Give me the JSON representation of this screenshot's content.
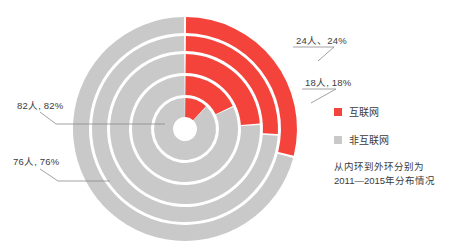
{
  "chart_data": {
    "type": "pie",
    "title": "",
    "subtitle": "",
    "variant": "nested-donut-sunburst",
    "center": {
      "x": 185,
      "y": 129
    },
    "start_angle_deg": 0,
    "direction": "clockwise",
    "inner_hole_radius": 12,
    "ring_gap": 3,
    "legend": {
      "position": "right",
      "entries": [
        {
          "label": "互联网",
          "color": "#f4433a"
        },
        {
          "label": "非互联网",
          "color": "#c9c9c9"
        }
      ]
    },
    "caption": "从内环到外环分别为\n2011—2015年分布情况",
    "categories": [
      "互联网",
      "非互联网"
    ],
    "rings": [
      {
        "name": "2011",
        "order": 1,
        "r_inner": 12,
        "r_outer": 31,
        "values": [
          12,
          88
        ],
        "slices": [
          {
            "label": "互联网",
            "value": 12,
            "color": "#f4433a"
          },
          {
            "label": "非互联网",
            "value": 88,
            "color": "#c9c9c9"
          }
        ]
      },
      {
        "name": "2012",
        "order": 2,
        "r_inner": 34,
        "r_outer": 53,
        "values": [
          18,
          82
        ],
        "slices": [
          {
            "label": "互联网",
            "value": 18,
            "color": "#f4433a"
          },
          {
            "label": "非互联网",
            "value": 82,
            "color": "#c9c9c9"
          }
        ]
      },
      {
        "name": "2013",
        "order": 3,
        "r_inner": 56,
        "r_outer": 75,
        "values": [
          24,
          76
        ],
        "slices": [
          {
            "label": "互联网",
            "value": 24,
            "color": "#f4433a"
          },
          {
            "label": "非互联网",
            "value": 76,
            "color": "#c9c9c9"
          }
        ]
      },
      {
        "name": "2014",
        "order": 4,
        "r_inner": 78,
        "r_outer": 93,
        "values": [
          26,
          74
        ],
        "slices": [
          {
            "label": "互联网",
            "value": 26,
            "color": "#f4433a"
          },
          {
            "label": "非互联网",
            "value": 74,
            "color": "#c9c9c9"
          }
        ]
      },
      {
        "name": "2015",
        "order": 5,
        "r_inner": 96,
        "r_outer": 112,
        "values": [
          29,
          71
        ],
        "slices": [
          {
            "label": "互联网",
            "value": 29,
            "color": "#f4433a"
          },
          {
            "label": "非互联网",
            "value": 71,
            "color": "#c9c9c9"
          }
        ]
      }
    ],
    "annotations": [
      {
        "id": "a24",
        "text": "24人、24%",
        "ring": "2013",
        "slice": "互联网",
        "value": 24,
        "unit_count": 24,
        "percent": "24%",
        "x": 296,
        "y": 36,
        "leader": [
          [
            293,
            47
          ],
          [
            334,
            47
          ],
          [
            318,
            61
          ]
        ]
      },
      {
        "id": "a18",
        "text": "18人, 18%",
        "ring": "2012",
        "slice": "互联网",
        "value": 18,
        "unit_count": 18,
        "percent": "18%",
        "x": 305,
        "y": 78,
        "leader": [
          [
            302,
            89
          ],
          [
            336,
            89
          ],
          [
            311,
            103
          ]
        ]
      },
      {
        "id": "a82",
        "text": "82人, 82%",
        "ring": "2012",
        "slice": "非互联网",
        "value": 82,
        "unit_count": 82,
        "percent": "82%",
        "x": 17,
        "y": 101,
        "leader": [
          [
            40,
            112
          ],
          [
            56,
            124
          ],
          [
            165,
            124
          ]
        ]
      },
      {
        "id": "a76",
        "text": "76人, 76%",
        "ring": "2013",
        "slice": "非互联网",
        "value": 76,
        "unit_count": 76,
        "percent": "76%",
        "x": 13,
        "y": 157,
        "leader": [
          [
            40,
            169
          ],
          [
            58,
            181
          ],
          [
            110,
            181
          ]
        ]
      }
    ],
    "colors": {
      "accent_red": "#f4433a",
      "gray": "#c9c9c9",
      "text": "#3b3b3b",
      "leader": "#8a8a8a",
      "background": "#ffffff"
    }
  },
  "labels": {
    "a24": "24人、24%",
    "a18": "18人, 18%",
    "a82": "82人, 82%",
    "a76": "76人, 76%"
  },
  "legend": {
    "internet": "互联网",
    "non_internet": "非互联网",
    "caption": "从内环到外环分别为\n2011—2015年分布情况"
  }
}
